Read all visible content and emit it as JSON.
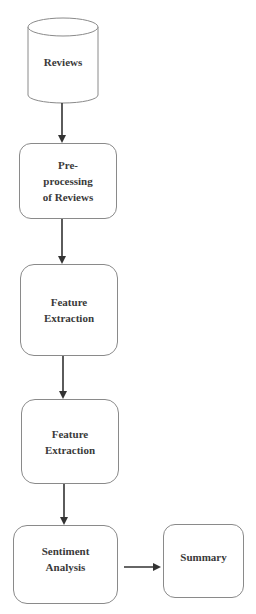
{
  "diagram": {
    "type": "flowchart",
    "direction": "top-to-bottom",
    "colors": {
      "stroke": "#8a8a8a",
      "arrow": "#333333",
      "text": "#3a3a3a",
      "background": "#ffffff"
    },
    "nodes": [
      {
        "id": "reviews",
        "shape": "cylinder",
        "label": "Reviews"
      },
      {
        "id": "preprocessing",
        "shape": "rounded-rect",
        "label": "Pre-\nprocessing\nof Reviews"
      },
      {
        "id": "feature1",
        "shape": "rounded-rect",
        "label": "Feature\nExtraction"
      },
      {
        "id": "feature2",
        "shape": "rounded-rect",
        "label": "Feature\nExtraction"
      },
      {
        "id": "sentiment",
        "shape": "rounded-rect",
        "label": "Sentiment\nAnalysis"
      },
      {
        "id": "summary",
        "shape": "rounded-rect",
        "label": "Summary"
      }
    ],
    "edges": [
      {
        "from": "reviews",
        "to": "preprocessing"
      },
      {
        "from": "preprocessing",
        "to": "feature1"
      },
      {
        "from": "feature1",
        "to": "feature2"
      },
      {
        "from": "feature2",
        "to": "sentiment"
      },
      {
        "from": "sentiment",
        "to": "summary"
      }
    ]
  }
}
